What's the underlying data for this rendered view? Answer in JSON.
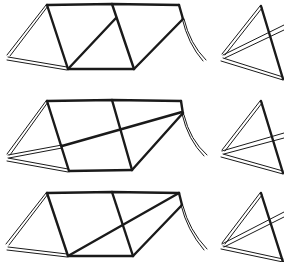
{
  "figure": {
    "colors": {
      "line": "#1a1a1a",
      "background": "#ffffff"
    },
    "rows": [
      {
        "id": "variant-1",
        "offset_y": 0,
        "diagonal_type": "mid-diagonal"
      },
      {
        "id": "variant-2",
        "offset_y": 95,
        "diagonal_type": "long-diagonal-from-rear"
      },
      {
        "id": "variant-3",
        "offset_y": 186,
        "diagonal_type": "long-diagonal-from-bottom-bracket"
      }
    ]
  }
}
